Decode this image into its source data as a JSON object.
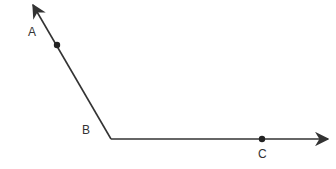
{
  "diagram": {
    "stroke_color": "#333333",
    "points": {
      "A": {
        "label": "A",
        "x": 57,
        "y": 45,
        "label_x": 32,
        "label_y": 36
      },
      "B": {
        "label": "B",
        "x": 111,
        "y": 139,
        "label_x": 87,
        "label_y": 134
      },
      "C": {
        "label": "C",
        "x": 262,
        "y": 139,
        "label_x": 264,
        "label_y": 158
      }
    },
    "rays": [
      {
        "name": "ray-BA",
        "from": "B",
        "through": "A",
        "tip_x": 33,
        "tip_y": 5
      },
      {
        "name": "ray-BC",
        "from": "B",
        "through": "C",
        "tip_x": 328,
        "tip_y": 139
      }
    ]
  }
}
